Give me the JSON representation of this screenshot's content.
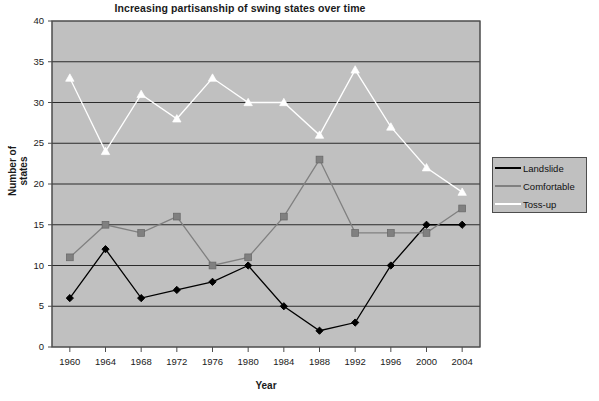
{
  "chart_data": {
    "type": "line",
    "title": "Increasing partisanship of swing states over time",
    "xlabel": "Year",
    "ylabel": "Number of states",
    "categories": [
      1960,
      1964,
      1968,
      1972,
      1976,
      1980,
      1984,
      1988,
      1992,
      1996,
      2000,
      2004
    ],
    "xtick_labels": [
      "1960",
      "1964",
      "1968",
      "1972",
      "1976",
      "1980",
      "1984",
      "1988",
      "1992",
      "1996",
      "2000",
      "2004"
    ],
    "ytick_labels": [
      "0",
      "5",
      "10",
      "15",
      "20",
      "25",
      "30",
      "35",
      "40"
    ],
    "ylim": [
      0,
      40
    ],
    "ytick_step": 5,
    "grid": "horizontal",
    "legend_position": "right",
    "plot_background": "#c0c0c0",
    "series": [
      {
        "name": "Landslide",
        "color": "#000000",
        "marker": "diamond",
        "values": [
          6,
          12,
          6,
          7,
          8,
          10,
          5,
          2,
          3,
          10,
          15,
          15
        ]
      },
      {
        "name": "Comfortable",
        "color": "#808080",
        "marker": "square",
        "values": [
          11,
          15,
          14,
          16,
          10,
          11,
          16,
          23,
          14,
          14,
          14,
          17
        ]
      },
      {
        "name": "Toss-up",
        "color": "#ffffff",
        "marker": "triangle",
        "values": [
          33,
          24,
          31,
          28,
          33,
          30,
          30,
          26,
          34,
          27,
          22,
          19
        ]
      }
    ]
  },
  "legend": {
    "items": [
      {
        "label": "Landslide"
      },
      {
        "label": "Comfortable"
      },
      {
        "label": "Toss-up"
      }
    ]
  }
}
